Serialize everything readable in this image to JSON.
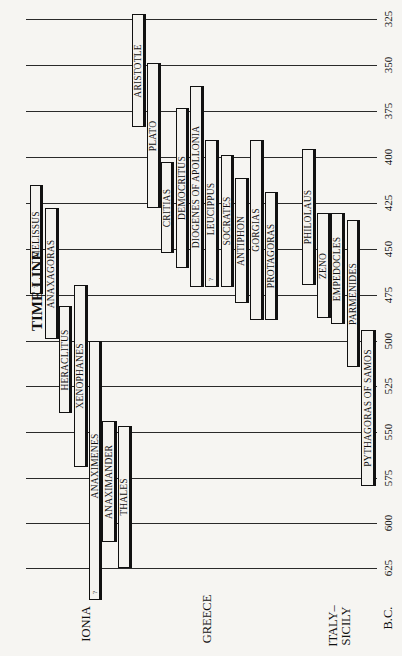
{
  "title": "TIME LINE",
  "axis": {
    "unit_label": "B.C.",
    "ticks": [
      "325",
      "350",
      "375",
      "400",
      "425",
      "450",
      "475",
      "500",
      "525",
      "550",
      "575",
      "600",
      "625"
    ]
  },
  "regions": [
    {
      "label": "IONIA"
    },
    {
      "label": "GREECE"
    },
    {
      "label": "ITALY–\nSICILY",
      "line1": "ITALY–",
      "line2": "SICILY"
    }
  ],
  "uncertain_marker": "?",
  "philosophers": [
    {
      "name": "MELISSUS",
      "region": "IONIA",
      "start_bc": 417,
      "end_bc": 476,
      "uncertain": true
    },
    {
      "name": "ANAXAGORAS",
      "region": "IONIA",
      "start_bc": 429,
      "end_bc": 500
    },
    {
      "name": "HERACLITUS",
      "region": "IONIA",
      "start_bc": 482,
      "end_bc": 540
    },
    {
      "name": "XENOPHANES",
      "region": "IONIA",
      "start_bc": 470,
      "end_bc": 570
    },
    {
      "name": "ANAXIMENES",
      "region": "IONIA",
      "start_bc": 500,
      "end_bc": 642,
      "uncertain": true
    },
    {
      "name": "ANAXIMANDER",
      "region": "IONIA",
      "start_bc": 545,
      "end_bc": 610
    },
    {
      "name": "THALES",
      "region": "IONIA",
      "start_bc": 548,
      "end_bc": 625
    },
    {
      "name": "ARISTOTLE",
      "region": "GREECE",
      "start_bc": 322,
      "end_bc": 384
    },
    {
      "name": "PLATO",
      "region": "GREECE",
      "start_bc": 348,
      "end_bc": 428
    },
    {
      "name": "CRITIAS",
      "region": "GREECE",
      "start_bc": 403,
      "end_bc": 453
    },
    {
      "name": "DEMOCRITUS",
      "region": "GREECE",
      "start_bc": 373,
      "end_bc": 460
    },
    {
      "name": "DIOGENES OF APOLLONIA",
      "region": "GREECE",
      "start_bc": 362,
      "end_bc": 471
    },
    {
      "name": "LEUCIPPUS",
      "region": "GREECE",
      "start_bc": 391,
      "end_bc": 471,
      "uncertain": true
    },
    {
      "name": "SOCRATES",
      "region": "GREECE",
      "start_bc": 399,
      "end_bc": 471
    },
    {
      "name": "ANTIPHON",
      "region": "GREECE",
      "start_bc": 411,
      "end_bc": 480
    },
    {
      "name": "GORGIAS",
      "region": "GREECE",
      "start_bc": 391,
      "end_bc": 490
    },
    {
      "name": "PROTAGORAS",
      "region": "GREECE",
      "start_bc": 419,
      "end_bc": 490
    },
    {
      "name": "PHILOLAUS",
      "region": "ITALY-SICILY",
      "start_bc": 396,
      "end_bc": 470
    },
    {
      "name": "ZENO",
      "region": "ITALY-SICILY",
      "start_bc": 431,
      "end_bc": 488
    },
    {
      "name": "EMPEDOCLES",
      "region": "ITALY-SICILY",
      "start_bc": 431,
      "end_bc": 491
    },
    {
      "name": "PARMENIDES",
      "region": "ITALY-SICILY",
      "start_bc": 435,
      "end_bc": 515
    },
    {
      "name": "PYTHAGORAS OF SAMOS",
      "region": "ITALY-SICILY",
      "start_bc": 495,
      "end_bc": 580
    }
  ],
  "layout": {
    "bars": [
      {
        "x": 30,
        "w": 13,
        "top": 185,
        "bottom": 294
      },
      {
        "x": 45,
        "w": 14,
        "top": 208,
        "bottom": 339
      },
      {
        "x": 59,
        "w": 13,
        "top": 306,
        "bottom": 413
      },
      {
        "x": 74,
        "w": 14,
        "top": 285,
        "bottom": 467
      },
      {
        "x": 89,
        "w": 13,
        "top": 341,
        "bottom": 600
      },
      {
        "x": 102,
        "w": 15,
        "top": 421,
        "bottom": 542
      },
      {
        "x": 118,
        "w": 14,
        "top": 426,
        "bottom": 568
      },
      {
        "x": 132,
        "w": 14,
        "top": 14,
        "bottom": 127
      },
      {
        "x": 147,
        "w": 14,
        "top": 63,
        "bottom": 208
      },
      {
        "x": 161,
        "w": 13,
        "top": 162,
        "bottom": 253
      },
      {
        "x": 176,
        "w": 13,
        "top": 108,
        "bottom": 268
      },
      {
        "x": 190,
        "w": 14,
        "top": 86,
        "bottom": 287
      },
      {
        "x": 205,
        "w": 14,
        "top": 140,
        "bottom": 287
      },
      {
        "x": 221,
        "w": 13,
        "top": 155,
        "bottom": 287
      },
      {
        "x": 235,
        "w": 14,
        "top": 178,
        "bottom": 303
      },
      {
        "x": 250,
        "w": 14,
        "top": 140,
        "bottom": 320
      },
      {
        "x": 265,
        "w": 13,
        "top": 192,
        "bottom": 320
      },
      {
        "x": 302,
        "w": 14,
        "top": 149,
        "bottom": 285
      },
      {
        "x": 317,
        "w": 14,
        "top": 213,
        "bottom": 318
      },
      {
        "x": 331,
        "w": 14,
        "top": 213,
        "bottom": 324
      },
      {
        "x": 347,
        "w": 13,
        "top": 220,
        "bottom": 367
      },
      {
        "x": 361,
        "w": 15,
        "top": 330,
        "bottom": 486
      }
    ],
    "gridline_y": [
      19,
      65,
      111,
      157,
      203,
      249,
      295,
      341,
      386,
      432,
      478,
      523,
      568
    ]
  }
}
